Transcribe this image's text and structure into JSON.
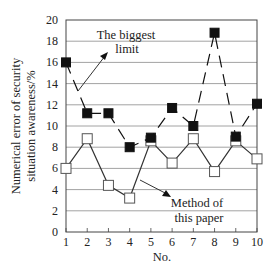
{
  "chart_data": {
    "type": "line",
    "title": "",
    "xlabel": "No.",
    "ylabel": "Numerical error of security situation awareness/%",
    "ylabel_lines": [
      "Numerical error of security",
      "situation awareness/%"
    ],
    "x": [
      1,
      2,
      3,
      4,
      5,
      6,
      7,
      8,
      9,
      10
    ],
    "x_tick_labels": [
      "1",
      "2",
      "3",
      "4",
      "5",
      "6",
      "7",
      "8",
      "9",
      "10"
    ],
    "y_ticks": [
      0,
      2,
      4,
      6,
      8,
      10,
      12,
      14,
      16,
      18,
      20
    ],
    "y_tick_labels": [
      "0",
      "2",
      "4",
      "6",
      "8",
      "10",
      "12",
      "14",
      "16",
      "18",
      "20"
    ],
    "ylim": [
      0,
      20
    ],
    "xlim": [
      1,
      10
    ],
    "grid": {
      "horizontal": true,
      "vertical": false
    },
    "legend": "none (inline annotations with arrows)",
    "series": [
      {
        "name": "The biggest limit",
        "marker": "filled-square",
        "line": "dashed",
        "color": "#111111",
        "values": [
          16.0,
          11.2,
          11.2,
          8.0,
          8.9,
          11.7,
          10.0,
          18.8,
          9.0,
          12.1
        ]
      },
      {
        "name": "Method of this paper",
        "marker": "open-square",
        "line": "solid",
        "color": "#333333",
        "values": [
          6.0,
          8.8,
          4.4,
          3.2,
          8.6,
          6.5,
          8.8,
          5.7,
          8.6,
          6.9
        ]
      }
    ],
    "annotations": [
      {
        "lines": [
          "The biggest",
          "limit"
        ],
        "points_to_series": "The biggest limit"
      },
      {
        "lines": [
          "Method of",
          "this paper"
        ],
        "points_to_series": "Method of this paper"
      }
    ]
  }
}
